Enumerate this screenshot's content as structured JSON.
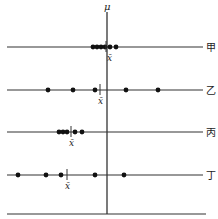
{
  "axis": {
    "label": "μ",
    "x": 107,
    "y_top": 12,
    "y_bottom": 214
  },
  "xbar_label": "x̄",
  "rows": [
    {
      "name": "甲",
      "y": 47,
      "dots": [
        93,
        97,
        101,
        105,
        110,
        116
      ],
      "xbar": 106
    },
    {
      "name": "乙",
      "y": 90,
      "dots": [
        48,
        73,
        95,
        126,
        158
      ],
      "xbar": 100
    },
    {
      "name": "丙",
      "y": 132,
      "dots": [
        59,
        63,
        67,
        75,
        82
      ],
      "xbar": 71
    },
    {
      "name": "丁",
      "y": 175,
      "dots": [
        18,
        46,
        61,
        95,
        124
      ],
      "xbar": 67
    }
  ],
  "baseline": {
    "y": 214,
    "x1": 7,
    "x2": 206
  },
  "line": {
    "x1": 7,
    "x2": 203
  },
  "colors": {
    "line": "#333333",
    "dot": "#111111"
  }
}
